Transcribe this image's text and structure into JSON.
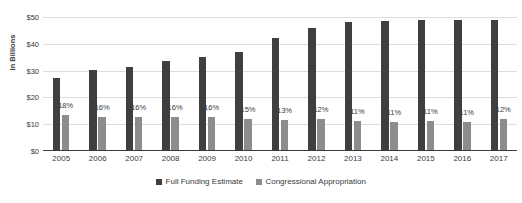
{
  "chart_data": {
    "type": "bar",
    "title": "",
    "subtitle": "",
    "xlabel": "",
    "ylabel": "In Billions",
    "ylim": [
      0,
      50
    ],
    "ytick_labels": [
      "$0",
      "$10",
      "$20",
      "$30",
      "$40",
      "$50"
    ],
    "ytick_values": [
      0,
      10,
      20,
      30,
      40,
      50
    ],
    "grid": true,
    "legend_position": "bottom-center",
    "categories": [
      "2005",
      "2006",
      "2007",
      "2008",
      "2009",
      "2010",
      "2011",
      "2012",
      "2013",
      "2014",
      "2015",
      "2016",
      "2017"
    ],
    "series": [
      {
        "name": "Full Funding Estimate",
        "color": "#3f3f3f",
        "values": [
          27.2,
          30.2,
          31.5,
          33.5,
          35.0,
          37.0,
          42.2,
          46.0,
          48.3,
          48.5,
          49.0,
          48.8,
          48.8
        ]
      },
      {
        "name": "Congressional Appropriation",
        "color": "#8c8c8c",
        "values": [
          13.5,
          12.6,
          12.8,
          12.8,
          12.8,
          12.0,
          11.6,
          12.0,
          11.2,
          11.0,
          11.2,
          11.0,
          12.1
        ]
      }
    ],
    "annotations": {
      "label": "share of full funding estimate met by appropriation",
      "values": [
        "18%",
        "16%",
        "16%",
        "16%",
        "16%",
        "15%",
        "13%",
        "12%",
        "11%",
        "11%",
        "11%",
        "11%",
        "12%"
      ]
    }
  },
  "legend": {
    "items": [
      {
        "label": "Full Funding Estimate",
        "color": "#3f3f3f"
      },
      {
        "label": "Congressional Appropriation",
        "color": "#8c8c8c"
      }
    ]
  }
}
